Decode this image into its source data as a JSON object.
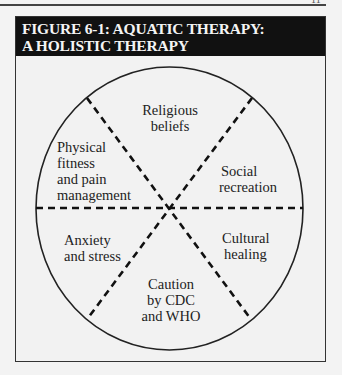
{
  "page": {
    "page_number": "11"
  },
  "figure": {
    "title_line1": "FIGURE 6-1: AQUATIC THERAPY:",
    "title_line2": "A HOLISTIC THERAPY",
    "center_label": "Aquatic therapy",
    "segments": [
      {
        "position": "top",
        "line1": "Religious",
        "line2": "beliefs"
      },
      {
        "position": "upper-right",
        "line1": "Social",
        "line2": "recreation"
      },
      {
        "position": "lower-right",
        "line1": "Cultural",
        "line2": "healing"
      },
      {
        "position": "bottom",
        "line1": "Caution",
        "line2": "by CDC",
        "line3": "and WHO"
      },
      {
        "position": "lower-left",
        "line1": "Anxiety",
        "line2": "and stress"
      },
      {
        "position": "upper-left",
        "line1": "Physical",
        "line2": "fitness",
        "line3": "and pain",
        "line4": "management"
      }
    ],
    "colors": {
      "title_bg": "#111111",
      "title_text": "#f4f4f4",
      "background": "#f2f2f2",
      "line": "#222222"
    }
  }
}
